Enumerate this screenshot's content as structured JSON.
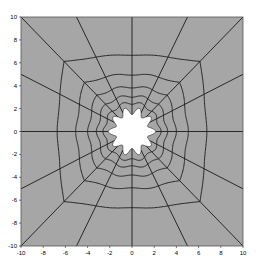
{
  "chart_data": {
    "type": "mesh",
    "title": "",
    "xlabel": "",
    "ylabel": "",
    "xlim": [
      -10,
      10
    ],
    "ylim": [
      -10,
      10
    ],
    "xticks": [
      -10,
      -8,
      -6,
      -4,
      -2,
      0,
      2,
      4,
      6,
      8,
      10
    ],
    "yticks": [
      -10,
      -8,
      -6,
      -4,
      -2,
      0,
      2,
      4,
      6,
      8,
      10
    ],
    "grid": false,
    "legend": null,
    "outer_boundary": {
      "shape": "square",
      "half_width": 10
    },
    "hole": {
      "shape": "scalloped-circle",
      "radius": 1.8,
      "lobes": 10,
      "lobe_amplitude": 0.18
    },
    "radial_lines": {
      "count": 16,
      "boundary_points": [
        [
          10,
          0
        ],
        [
          10,
          5
        ],
        [
          10,
          10
        ],
        [
          5,
          10
        ],
        [
          0,
          10
        ],
        [
          -5,
          10
        ],
        [
          -10,
          10
        ],
        [
          -10,
          5
        ],
        [
          -10,
          0
        ],
        [
          -10,
          -5
        ],
        [
          -10,
          -10
        ],
        [
          -5,
          -10
        ],
        [
          0,
          -10
        ],
        [
          5,
          -10
        ],
        [
          10,
          -10
        ],
        [
          10,
          -5
        ]
      ]
    },
    "rings": {
      "count": 6,
      "axis_positions": [
        10,
        6.7,
        5.0,
        3.9,
        3.1,
        2.5
      ]
    },
    "colors": {
      "mesh_fill": "#a6a6a6",
      "mesh_lines": "#1a1a1a",
      "hole_fill": "#ffffff",
      "axis": "#000000",
      "background": "#ffffff"
    }
  },
  "axes": {
    "x_tick_labels": [
      "-10",
      "-8",
      "-6",
      "-4",
      "-2",
      "0",
      "2",
      "4",
      "6",
      "8",
      "10"
    ],
    "y_tick_labels": [
      "10",
      "8",
      "6",
      "4",
      "2",
      "0",
      "-2",
      "-4",
      "-6",
      "-8",
      "-10"
    ]
  }
}
